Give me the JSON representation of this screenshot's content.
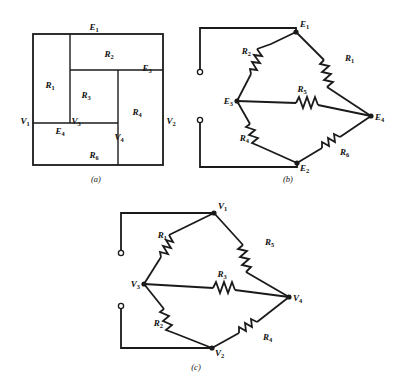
{
  "figure": {
    "background": "#ffffff",
    "ink": "#1a1a1a",
    "captions": [
      {
        "id": "cap-a",
        "text": "(a)",
        "x": 96,
        "y": 182
      },
      {
        "id": "cap-b",
        "text": "(b)",
        "x": 288,
        "y": 182
      },
      {
        "id": "cap-c",
        "text": "(c)",
        "x": 196,
        "y": 370
      }
    ]
  },
  "panel_a": {
    "name": "rectangle-dissection-diagram",
    "frame": {
      "x": 33,
      "y": 34,
      "w": 130,
      "h": 131
    },
    "labels": [
      {
        "id": "E1",
        "base": "E",
        "sub": "1",
        "x": 94,
        "y": 30,
        "anchor": "middle"
      },
      {
        "id": "R2",
        "base": "R",
        "sub": "2",
        "x": 109,
        "y": 57,
        "anchor": "middle"
      },
      {
        "id": "E3",
        "base": "E",
        "sub": "3",
        "x": 147,
        "y": 71,
        "anchor": "middle"
      },
      {
        "id": "R1",
        "base": "R",
        "sub": "1",
        "x": 50,
        "y": 88,
        "anchor": "middle"
      },
      {
        "id": "R3",
        "base": "R",
        "sub": "3",
        "x": 86,
        "y": 98,
        "anchor": "middle"
      },
      {
        "id": "R4",
        "base": "R",
        "sub": "4",
        "x": 137,
        "y": 115,
        "anchor": "middle"
      },
      {
        "id": "V1",
        "base": "V",
        "sub": "1",
        "x": 25,
        "y": 124,
        "anchor": "middle"
      },
      {
        "id": "V3",
        "base": "V",
        "sub": "3",
        "x": 76,
        "y": 124,
        "anchor": "middle"
      },
      {
        "id": "V2",
        "base": "V",
        "sub": "2",
        "x": 171,
        "y": 124,
        "anchor": "middle"
      },
      {
        "id": "E4",
        "base": "E",
        "sub": "4",
        "x": 60,
        "y": 134,
        "anchor": "middle"
      },
      {
        "id": "V4",
        "base": "V",
        "sub": "4",
        "x": 119,
        "y": 140,
        "anchor": "middle"
      },
      {
        "id": "R6",
        "base": "R",
        "sub": "6",
        "x": 94,
        "y": 158,
        "anchor": "middle"
      }
    ]
  },
  "panel_b": {
    "name": "bridge-network-diagram-b",
    "nodes": [
      {
        "id": "E1",
        "base": "E",
        "sub": "1",
        "x": 296,
        "y": 32,
        "lx": 300,
        "ly": 27,
        "anchor": "start"
      },
      {
        "id": "E3",
        "base": "E",
        "sub": "3",
        "x": 237,
        "y": 101,
        "lx": 233,
        "ly": 104,
        "anchor": "end"
      },
      {
        "id": "E4",
        "base": "E",
        "sub": "4",
        "x": 371,
        "y": 116,
        "lx": 375,
        "ly": 120,
        "anchor": "start"
      },
      {
        "id": "E2",
        "base": "E",
        "sub": "2",
        "x": 297,
        "y": 163,
        "lx": 300,
        "ly": 171,
        "anchor": "start"
      }
    ],
    "resistors": [
      {
        "id": "R2",
        "base": "R",
        "sub": "2",
        "lx": 251,
        "ly": 54,
        "anchor": "end"
      },
      {
        "id": "R1",
        "base": "R",
        "sub": "1",
        "lx": 345,
        "ly": 61,
        "anchor": "start"
      },
      {
        "id": "R5",
        "base": "R",
        "sub": "5",
        "lx": 302,
        "ly": 92,
        "anchor": "middle"
      },
      {
        "id": "R4",
        "base": "R",
        "sub": "4",
        "lx": 249,
        "ly": 141,
        "anchor": "end"
      },
      {
        "id": "R6",
        "base": "R",
        "sub": "6",
        "lx": 340,
        "ly": 155,
        "anchor": "start"
      }
    ],
    "terminals": [
      {
        "id": "term-top",
        "x": 200,
        "y": 72
      },
      {
        "id": "term-bottom",
        "x": 200,
        "y": 120
      }
    ]
  },
  "panel_c": {
    "name": "bridge-network-diagram-c",
    "nodes": [
      {
        "id": "V1",
        "base": "V",
        "sub": "1",
        "x": 214,
        "y": 213,
        "lx": 218,
        "ly": 209,
        "anchor": "start"
      },
      {
        "id": "V3",
        "base": "V",
        "sub": "3",
        "x": 144,
        "y": 284,
        "lx": 140,
        "ly": 287,
        "anchor": "end"
      },
      {
        "id": "V4",
        "base": "V",
        "sub": "4",
        "x": 289,
        "y": 297,
        "lx": 293,
        "ly": 301,
        "anchor": "start"
      },
      {
        "id": "V2",
        "base": "V",
        "sub": "2",
        "x": 212,
        "y": 348,
        "lx": 215,
        "ly": 356,
        "anchor": "start"
      }
    ],
    "resistors": [
      {
        "id": "R1",
        "base": "R",
        "sub": "1",
        "lx": 167,
        "ly": 238,
        "anchor": "end"
      },
      {
        "id": "R5",
        "base": "R",
        "sub": "5",
        "lx": 265,
        "ly": 245,
        "anchor": "start"
      },
      {
        "id": "R3",
        "base": "R",
        "sub": "3",
        "lx": 222,
        "ly": 277,
        "anchor": "middle"
      },
      {
        "id": "R2",
        "base": "R",
        "sub": "2",
        "lx": 163,
        "ly": 326,
        "anchor": "end"
      },
      {
        "id": "R4",
        "base": "R",
        "sub": "4",
        "lx": 263,
        "ly": 340,
        "anchor": "start"
      }
    ],
    "terminals": [
      {
        "id": "term-top",
        "x": 121,
        "y": 253
      },
      {
        "id": "term-bottom",
        "x": 121,
        "y": 306
      }
    ]
  }
}
